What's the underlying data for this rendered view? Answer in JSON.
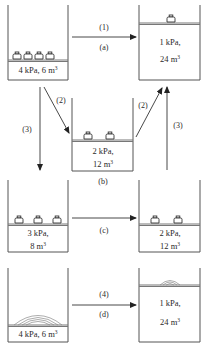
{
  "diagram": {
    "type": "thermodynamic-process-paths",
    "states": {
      "a_initial": {
        "pressure": "4 kPa",
        "volume": "6 m",
        "label": "4 kPa, 6 m",
        "weights": 4
      },
      "a_final": {
        "line1": "1 kPa,",
        "line2": "24 m",
        "weights": 1
      },
      "b_mid": {
        "line1": "2 kPa,",
        "line2": "12 m",
        "weights": 2
      },
      "c_initial": {
        "line1": "3 kPa,",
        "line2": "8 m",
        "weights": 3
      },
      "c_final": {
        "line1": "2 kPa,",
        "line2": "12 m",
        "weights": 2
      },
      "d_initial": {
        "label": "4 kPa, 6 m",
        "load": "sand"
      },
      "d_final": {
        "line1": "1 kPa,",
        "line2": "24 m",
        "load": "sand"
      }
    },
    "superscript": "3",
    "process_labels": {
      "p1": "(1)",
      "pa": "(a)",
      "p2_down": "(2)",
      "p2_up": "(2)",
      "p3_down": "(3)",
      "p3_up": "(3)",
      "pb": "(b)",
      "pc": "(c)",
      "p4": "(4)",
      "pd": "(d)"
    }
  }
}
